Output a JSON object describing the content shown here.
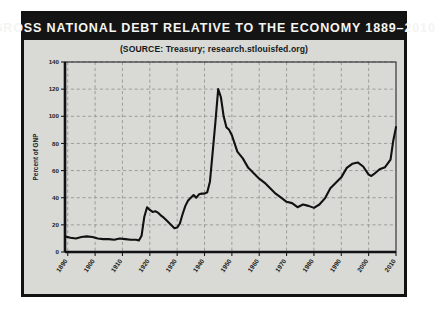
{
  "figure": {
    "title": "GROSS NATIONAL DEBT RELATIVE TO THE ECONOMY 1889–2010",
    "source": "(SOURCE: Treasury; research.stlouisfed.org)",
    "background_color": "#d9d9d5",
    "title_bar_color": "#141414",
    "frame_color": "#121212",
    "line_color": "#111111",
    "grid_color": "#8e8e8a"
  },
  "chart_data": {
    "type": "line",
    "title": "GROSS NATIONAL DEBT RELATIVE TO THE ECONOMY 1889–2010",
    "subtitle": "(SOURCE: Treasury; research.stlouisfed.org)",
    "xlabel": "",
    "ylabel": "Percent of GNP",
    "xlim": [
      1889,
      2010
    ],
    "ylim": [
      0,
      140
    ],
    "grid": true,
    "legend": "none",
    "xticks": [
      1890,
      1900,
      1910,
      1920,
      1930,
      1940,
      1950,
      1960,
      1970,
      1980,
      1990,
      2000,
      2010
    ],
    "yticks": [
      0,
      20,
      40,
      60,
      80,
      100,
      120,
      140
    ],
    "series": [
      {
        "name": "Gross National Debt as Percent of GNP",
        "x": [
          1889,
          1891,
          1893,
          1895,
          1897,
          1899,
          1901,
          1903,
          1905,
          1907,
          1909,
          1911,
          1913,
          1915,
          1916,
          1917,
          1918,
          1919,
          1920,
          1921,
          1922,
          1923,
          1924,
          1925,
          1926,
          1927,
          1928,
          1929,
          1930,
          1931,
          1932,
          1933,
          1934,
          1935,
          1936,
          1937,
          1938,
          1939,
          1940,
          1941,
          1942,
          1943,
          1944,
          1945,
          1946,
          1947,
          1948,
          1949,
          1950,
          1952,
          1954,
          1956,
          1958,
          1960,
          1962,
          1964,
          1966,
          1968,
          1970,
          1972,
          1974,
          1976,
          1978,
          1980,
          1982,
          1984,
          1986,
          1988,
          1990,
          1992,
          1994,
          1996,
          1998,
          2000,
          2001,
          2002,
          2004,
          2006,
          2008,
          2009,
          2010
        ],
        "y": [
          11.5,
          10.5,
          10.0,
          11.0,
          11.5,
          11.0,
          10.0,
          9.5,
          9.5,
          9.0,
          10.0,
          9.5,
          9.0,
          9.0,
          8.5,
          12.0,
          26.0,
          33.0,
          31.0,
          29.5,
          30.0,
          29.0,
          27.0,
          25.5,
          23.5,
          21.5,
          19.5,
          17.5,
          18.0,
          21.0,
          28.0,
          34.0,
          38.0,
          40.0,
          42.0,
          40.0,
          42.5,
          43.0,
          43.0,
          44.0,
          52.0,
          74.0,
          96.0,
          120.0,
          114.0,
          100.0,
          92.0,
          90.0,
          86.0,
          74.0,
          69.0,
          62.0,
          58.0,
          54.0,
          51.0,
          47.0,
          43.0,
          40.0,
          37.0,
          36.0,
          33.0,
          35.0,
          34.0,
          32.5,
          35.0,
          39.5,
          47.0,
          51.0,
          55.0,
          62.0,
          65.0,
          66.0,
          63.0,
          57.0,
          56.0,
          57.5,
          61.0,
          62.5,
          68.0,
          82.0,
          92.0
        ]
      }
    ],
    "annotations": [
      {
        "label": "World War I peak",
        "x": 1919,
        "y": 33
      },
      {
        "label": "World War II peak",
        "x": 1945,
        "y": 120
      },
      {
        "label": "Post-war trough",
        "x": 1980,
        "y": 32.5
      }
    ]
  },
  "axes": {
    "y_title": "Percent of GNP",
    "y_tick_labels": [
      "0",
      "20",
      "40",
      "60",
      "80",
      "100",
      "120",
      "140"
    ],
    "x_tick_labels": [
      "1890",
      "1900",
      "1910",
      "1920",
      "1930",
      "1940",
      "1950",
      "1960",
      "1970",
      "1980",
      "1990",
      "2000",
      "2010"
    ]
  }
}
